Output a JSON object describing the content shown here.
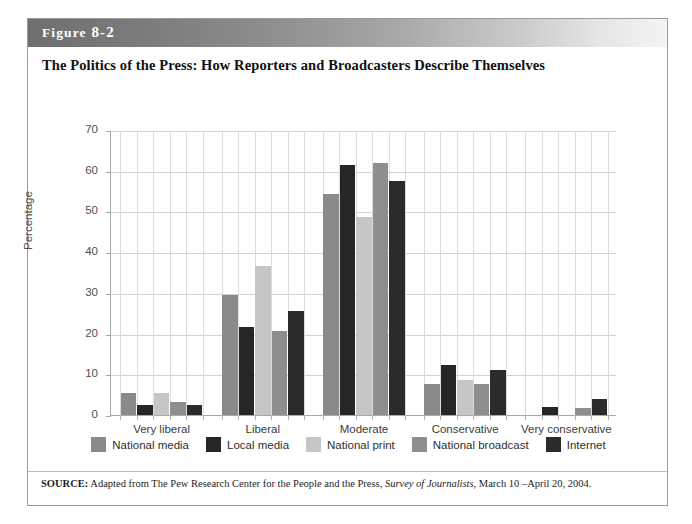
{
  "figure": {
    "label_prefix": "Figure",
    "label_number": "8-2",
    "title": "The Politics of the Press: How Reporters and Broadcasters Describe Themselves",
    "source_prefix": "SOURCE:",
    "source_text_before": " Adapted from The Pew Research Center for the People and the Press, ",
    "source_italic": "Survey of Journalists",
    "source_text_after": ", March 10 –April 20, 2004."
  },
  "colors": {
    "national_media": "#8a8a8a",
    "local_media": "#262626",
    "national_print": "#c6c6c6",
    "national_broadcast": "#8e8e8e",
    "internet": "#2b2b2b",
    "gridline": "#d2d2d2",
    "axis": "#a9a9a9",
    "header_dark": "#6f6f6f",
    "header_light": "#f4f4f4"
  },
  "chart_data": {
    "type": "bar",
    "title": "The Politics of the Press: How Reporters and Broadcasters Describe Themselves",
    "xlabel": "",
    "ylabel": "Percentage",
    "ylim": [
      0,
      70
    ],
    "yticks": [
      0,
      10,
      20,
      30,
      40,
      50,
      60,
      70
    ],
    "grid": true,
    "legend_position": "bottom",
    "categories": [
      "Very liberal",
      "Liberal",
      "Moderate",
      "Conservative",
      "Very conservative"
    ],
    "series": [
      {
        "name": "National media",
        "color": "#8a8a8a",
        "values": [
          5.5,
          29.5,
          54.3,
          7.6,
          0
        ]
      },
      {
        "name": "Local media",
        "color": "#262626",
        "values": [
          2.4,
          21.5,
          61.5,
          12.2,
          2.0
        ]
      },
      {
        "name": "National print",
        "color": "#c6c6c6",
        "values": [
          5.3,
          36.5,
          48.7,
          8.7,
          0
        ]
      },
      {
        "name": "National broadcast",
        "color": "#8e8e8e",
        "values": [
          3.3,
          20.7,
          61.8,
          7.7,
          1.7
        ]
      },
      {
        "name": "Internet",
        "color": "#2b2b2b",
        "values": [
          2.5,
          25.5,
          57.5,
          11.0,
          4.0
        ]
      }
    ]
  }
}
